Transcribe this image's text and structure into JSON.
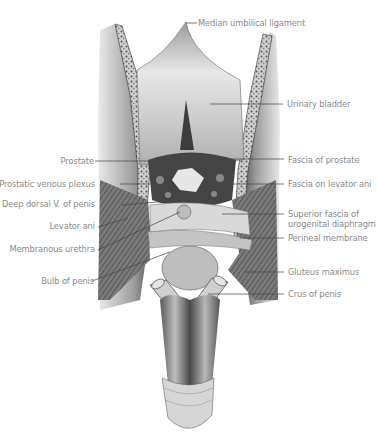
{
  "figure": {
    "type": "anatomical illustration"
  },
  "labels": {
    "left": [
      {
        "id": "prostate",
        "text": "Prostate"
      },
      {
        "id": "prostatic-venous-plexus",
        "text": "Prostatic venous plexus"
      },
      {
        "id": "deep-dorsal-vein",
        "text": "Deep dorsal V. of penis"
      },
      {
        "id": "levator-ani-left",
        "text": "Levator ani"
      },
      {
        "id": "membranous-urethra",
        "text": "Membranous urethra"
      },
      {
        "id": "bulb-of-penis",
        "text": "Bulb of penis"
      }
    ],
    "right": [
      {
        "id": "median-umbilical-ligament",
        "text": "Median umbilical ligament"
      },
      {
        "id": "urinary-bladder",
        "text": "Urinary bladder"
      },
      {
        "id": "fascia-of-prostate",
        "text": "Fascia of prostate"
      },
      {
        "id": "fascia-on-levator-ani",
        "text": "Fascia on levator ani"
      },
      {
        "id": "superior-fascia-line1",
        "text": "Superior fascia of"
      },
      {
        "id": "superior-fascia-line2",
        "text": "urogenital diaphragm"
      },
      {
        "id": "perineal-membrane",
        "text": "Perineal membrane"
      },
      {
        "id": "gluteus-maximus",
        "text": "Gluteus maximus"
      },
      {
        "id": "crus-of-penis",
        "text": "Crus of penis"
      }
    ]
  },
  "colors": {
    "label_text": "#8a8a8a",
    "leader_line": "#444444",
    "tissue_dark": "#3a3a3a",
    "tissue_mid": "#8c8c8c",
    "tissue_light": "#d8d8d8"
  }
}
